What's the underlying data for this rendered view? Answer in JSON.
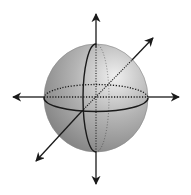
{
  "diagram": {
    "elements": {
      "sphere": "shaded-sphere",
      "equator": "equator-ellipse (front solid, back dotted)",
      "meridian": "meridian-ellipse (front solid, back dotted)",
      "axes": [
        "vertical-axis",
        "horizontal-axis",
        "depth-axis"
      ]
    },
    "colors": {
      "line": "#1a1a1a",
      "sphere_light": "#efefef",
      "sphere_mid": "#b4b4b4",
      "sphere_dark": "#7a7a7a",
      "background": "#ffffff"
    }
  }
}
